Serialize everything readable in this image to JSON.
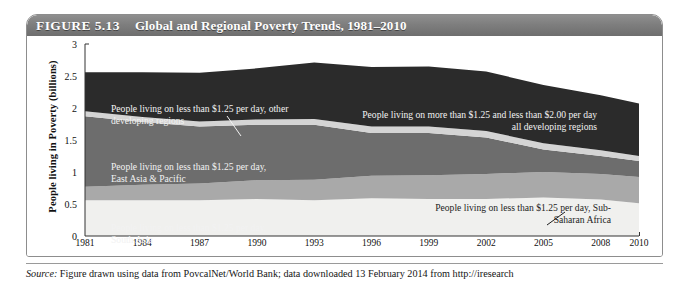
{
  "figure": {
    "number_label": "FIGURE 5.13",
    "title": "Global and Regional Poverty Trends, 1981–2010",
    "source_prefix": "Source:",
    "source_text": " Figure drawn using data from PovcalNet/World Bank; data downloaded 13 February 2014 from http://iresearch"
  },
  "annotations": {
    "other_developing": "People living on less than $1.25 per day, other\ndeveloping regions",
    "between_125_and_200": "People living on more than $1.25 and less than $2.00 per day\nall developing regions",
    "east_asia": "People living on less than $1.25 per day,\nEast Asia & Pacific",
    "south_asia": "People living on less than $1.25 per day,\nSouth Asia",
    "sub_saharan": "People living on less than $1.25 per day, Sub-\nSaharan Africa"
  },
  "colors": {
    "band_south_asia": "#f0f0ee",
    "band_sub_saharan": "#a9a9a9",
    "band_east_asia": "#6d6d6d",
    "band_other_developing": "#d4d4d4",
    "band_between_125_200": "#2b2b2b",
    "axis": "#333333",
    "title_bar": "#7e7e7e",
    "frame_border": "#8d8d8d"
  },
  "chart_data": {
    "type": "area",
    "stacked": true,
    "title": "Global and Regional Poverty Trends, 1981–2010",
    "xlabel": "",
    "ylabel": "People living in Poverty (billions)",
    "xlim": [
      1981,
      2010
    ],
    "ylim": [
      0,
      3
    ],
    "grid": false,
    "legend_position": "inline-annotations",
    "y_ticks": [
      "0",
      "0.5",
      "1",
      "1.5",
      "2",
      "2.5",
      "3"
    ],
    "y_tick_values": [
      0,
      0.5,
      1,
      1.5,
      2,
      2.5,
      3
    ],
    "x_ticks": [
      "1981",
      "1984",
      "1987",
      "1990",
      "1993",
      "1996",
      "1999",
      "2002",
      "2005",
      "2008",
      "2010"
    ],
    "x_tick_values": [
      1981,
      1984,
      1987,
      1990,
      1993,
      1996,
      1999,
      2002,
      2005,
      2008,
      2010
    ],
    "x": [
      1981,
      1984,
      1987,
      1990,
      1993,
      1996,
      1999,
      2002,
      2005,
      2008,
      2010
    ],
    "series": [
      {
        "name": "People living on less than $1.25 per day, South Asia",
        "color": "#f0f0ee",
        "values": [
          0.56,
          0.56,
          0.56,
          0.58,
          0.56,
          0.59,
          0.58,
          0.58,
          0.6,
          0.57,
          0.51
        ]
      },
      {
        "name": "People living on less than $1.25 per day, Sub-Saharan Africa",
        "color": "#a9a9a9",
        "values": [
          0.21,
          0.24,
          0.26,
          0.29,
          0.32,
          0.35,
          0.37,
          0.39,
          0.4,
          0.4,
          0.41
        ]
      },
      {
        "name": "People living on less than $1.25 per day, East Asia & Pacific",
        "color": "#6d6d6d",
        "values": [
          1.1,
          0.98,
          0.89,
          0.87,
          0.86,
          0.67,
          0.66,
          0.57,
          0.35,
          0.28,
          0.25
        ]
      },
      {
        "name": "People living on less than $1.25 per day, other developing regions",
        "color": "#d4d4d4",
        "values": [
          0.08,
          0.08,
          0.08,
          0.08,
          0.09,
          0.1,
          0.1,
          0.1,
          0.1,
          0.09,
          0.08
        ]
      },
      {
        "name": "People living on more than $1.25 and less than $2.00 per day, all developing regions",
        "color": "#2b2b2b",
        "values": [
          0.61,
          0.7,
          0.76,
          0.8,
          0.88,
          0.93,
          0.94,
          0.93,
          0.91,
          0.86,
          0.82
        ]
      }
    ],
    "totals": [
      2.56,
      2.56,
      2.55,
      2.62,
      2.71,
      2.64,
      2.65,
      2.57,
      2.36,
      2.2,
      2.07
    ]
  }
}
